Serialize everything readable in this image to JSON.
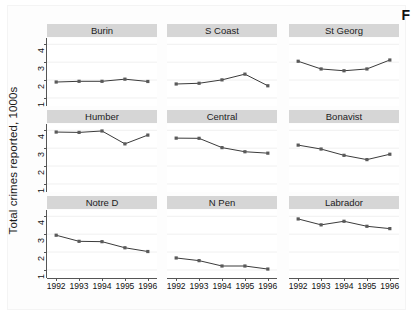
{
  "figure": {
    "corner_mark": "F",
    "ylabel": "Total crimes reported, 1000s",
    "background": "#ffffff",
    "strip_color": "#d6d6d6",
    "line_color": "#3b3b3b",
    "marker_color": "#5a5a5a",
    "gridline_color": "#f0f0f0"
  },
  "axes": {
    "y_ticks": [
      1,
      2,
      3,
      4
    ],
    "y_tick_labels": [
      "1",
      "2",
      "3",
      "4"
    ],
    "ylim": [
      0.55,
      4.35
    ],
    "x_ticks": [
      1992,
      1993,
      1994,
      1995,
      1996
    ],
    "x_tick_labels": [
      "1992",
      "1993",
      "1994",
      "1995",
      "1996"
    ],
    "xlim": [
      1991.6,
      1996.4
    ]
  },
  "chart_data": {
    "type": "line",
    "title": "",
    "subtitle": "",
    "xlabel": "",
    "ylabel": "Total crimes reported, 1000s",
    "x": [
      1992,
      1993,
      1994,
      1995,
      1996
    ],
    "xlim": [
      1991.6,
      1996.4
    ],
    "ylim": [
      0.55,
      4.35
    ],
    "grid": true,
    "legend": "none",
    "layout": {
      "rows": 3,
      "cols": 3,
      "small_multiples": true
    },
    "series": [
      {
        "name": "Burin",
        "row": 0,
        "col": 0,
        "values": [
          1.89,
          1.93,
          1.93,
          2.05,
          1.92
        ]
      },
      {
        "name": "S Coast",
        "row": 0,
        "col": 1,
        "values": [
          1.78,
          1.82,
          2.01,
          2.33,
          1.68
        ]
      },
      {
        "name": "St Georg",
        "row": 0,
        "col": 2,
        "values": [
          3.05,
          2.62,
          2.52,
          2.62,
          3.12
        ]
      },
      {
        "name": "Humber",
        "row": 1,
        "col": 0,
        "values": [
          3.9,
          3.88,
          3.96,
          3.24,
          3.73
        ]
      },
      {
        "name": "Central",
        "row": 1,
        "col": 1,
        "values": [
          3.56,
          3.55,
          3.03,
          2.8,
          2.72
        ]
      },
      {
        "name": "Bonavist",
        "row": 1,
        "col": 2,
        "values": [
          3.17,
          2.95,
          2.6,
          2.36,
          2.66
        ]
      },
      {
        "name": "Notre D",
        "row": 2,
        "col": 0,
        "values": [
          2.94,
          2.6,
          2.58,
          2.24,
          2.03
        ]
      },
      {
        "name": "N Pen",
        "row": 2,
        "col": 1,
        "values": [
          1.67,
          1.52,
          1.22,
          1.22,
          1.05
        ]
      },
      {
        "name": "Labrador",
        "row": 2,
        "col": 2,
        "values": [
          3.85,
          3.52,
          3.72,
          3.44,
          3.31
        ]
      }
    ]
  }
}
